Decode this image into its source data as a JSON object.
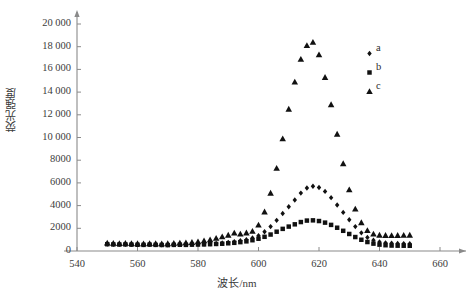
{
  "chart_data": {
    "type": "scatter",
    "title": "",
    "xlabel": "波长/nm",
    "ylabel": "荧光强度",
    "xlim": [
      540,
      660
    ],
    "ylim": [
      0,
      20000
    ],
    "xticks": [
      540,
      560,
      580,
      600,
      620,
      640,
      660
    ],
    "yticks": [
      0,
      2000,
      4000,
      6000,
      8000,
      10000,
      12000,
      14000,
      16000,
      18000,
      20000
    ],
    "ytick_labels": [
      "0",
      "2000",
      "4000",
      "6000",
      "8000",
      "10 000",
      "12 000",
      "14 000",
      "16 000",
      "18 000",
      "20 000"
    ],
    "xtick_labels": [
      "540",
      "560",
      "580",
      "600",
      "620",
      "640",
      "660"
    ],
    "grid": false,
    "legend_position": "upper-right",
    "marker_color": "#111111",
    "axis_color": "#8a8a8a",
    "x": [
      550,
      552,
      554,
      556,
      558,
      560,
      562,
      564,
      566,
      568,
      570,
      572,
      574,
      576,
      578,
      580,
      582,
      584,
      586,
      588,
      590,
      592,
      594,
      596,
      598,
      600,
      602,
      604,
      606,
      608,
      610,
      612,
      614,
      616,
      618,
      620,
      622,
      624,
      626,
      628,
      630,
      632,
      634,
      636,
      638,
      640,
      642,
      644,
      646,
      648,
      650
    ],
    "series": [
      {
        "name": "a",
        "marker": "diamond",
        "values": [
          620,
          600,
          590,
          600,
          580,
          570,
          560,
          580,
          560,
          550,
          540,
          560,
          570,
          560,
          580,
          600,
          620,
          640,
          660,
          700,
          760,
          820,
          900,
          1000,
          1150,
          1350,
          1700,
          2150,
          2700,
          3300,
          3900,
          4500,
          5100,
          5550,
          5700,
          5600,
          5250,
          4700,
          4050,
          3400,
          2750,
          2150,
          1600,
          1200,
          950,
          800,
          720,
          680,
          660,
          650,
          640
        ]
      },
      {
        "name": "b",
        "marker": "square",
        "values": [
          600,
          580,
          570,
          580,
          560,
          550,
          540,
          560,
          540,
          530,
          520,
          540,
          550,
          540,
          560,
          570,
          580,
          600,
          620,
          640,
          680,
          720,
          780,
          850,
          950,
          1080,
          1250,
          1450,
          1700,
          1950,
          2150,
          2350,
          2550,
          2680,
          2700,
          2640,
          2500,
          2300,
          2050,
          1780,
          1500,
          1230,
          990,
          790,
          650,
          560,
          510,
          480,
          470,
          465,
          460
        ]
      },
      {
        "name": "c",
        "marker": "triangle",
        "values": [
          700,
          680,
          670,
          680,
          660,
          650,
          640,
          660,
          650,
          640,
          650,
          680,
          700,
          720,
          760,
          820,
          900,
          1000,
          1120,
          1250,
          1400,
          1580,
          1500,
          1600,
          1750,
          2300,
          3450,
          5100,
          7300,
          9900,
          12500,
          14900,
          16900,
          18100,
          18400,
          17300,
          15300,
          12900,
          10300,
          7700,
          5400,
          3700,
          2500,
          1800,
          1500,
          1400,
          1380,
          1370,
          1380,
          1390,
          1400
        ]
      }
    ],
    "legend": [
      {
        "label": "a",
        "marker": "diamond"
      },
      {
        "label": "b",
        "marker": "square"
      },
      {
        "label": "c",
        "marker": "triangle"
      }
    ]
  }
}
